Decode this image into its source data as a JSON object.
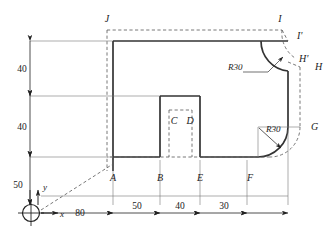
{
  "drawing": {
    "type": "engineering-outline-profile",
    "title_visible": false,
    "colors": {
      "outline": "#333333",
      "thin_line": "#555555",
      "hidden_line": "#555555",
      "text": "#1a1a1a",
      "background": "#ffffff"
    },
    "origin_marker": {
      "name": "origin-circle",
      "x_axis_label": "x",
      "y_axis_label": "y"
    },
    "point_labels": [
      {
        "id": "A",
        "text": "A"
      },
      {
        "id": "B",
        "text": "B"
      },
      {
        "id": "C",
        "text": "C"
      },
      {
        "id": "D",
        "text": "D"
      },
      {
        "id": "E",
        "text": "E"
      },
      {
        "id": "F",
        "text": "F"
      },
      {
        "id": "G",
        "text": "G"
      },
      {
        "id": "H",
        "text": "H"
      },
      {
        "id": "Hp",
        "text": "H'"
      },
      {
        "id": "I",
        "text": "I"
      },
      {
        "id": "Ip",
        "text": "I'"
      },
      {
        "id": "J",
        "text": "J"
      }
    ],
    "radius_callouts": [
      {
        "id": "R-top",
        "text": "R30"
      },
      {
        "id": "R-bottom",
        "text": "R30"
      }
    ],
    "horizontal_dimensions": [
      {
        "id": "h-80",
        "text": "80"
      },
      {
        "id": "h-50",
        "text": "50"
      },
      {
        "id": "h-40",
        "text": "40"
      },
      {
        "id": "h-30",
        "text": "30"
      }
    ],
    "vertical_dimensions": [
      {
        "id": "v-40-upper",
        "text": "40"
      },
      {
        "id": "v-40-lower",
        "text": "40"
      },
      {
        "id": "v-50",
        "text": "50"
      }
    ]
  }
}
